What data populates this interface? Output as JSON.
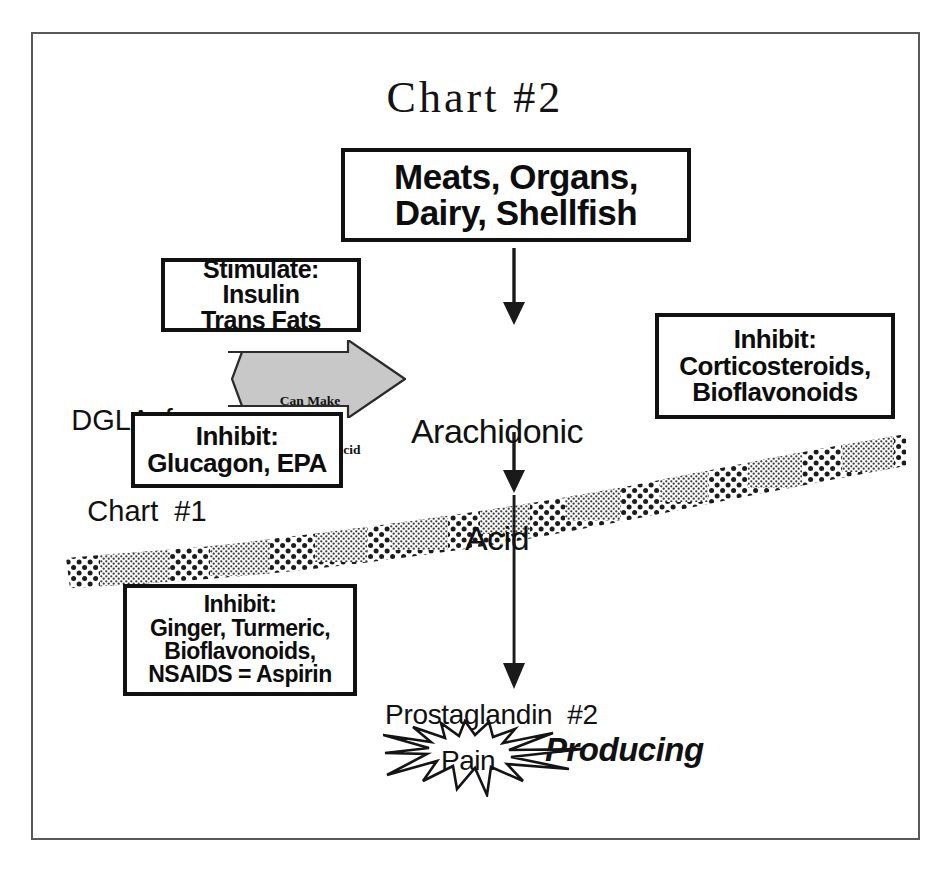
{
  "document": {
    "title": "Chart #2",
    "frame_color": "#595959"
  },
  "nodes": {
    "source": {
      "label_line1": "Meats, Organs,",
      "label_line2": "Dairy, Shellfish"
    },
    "arachidonic_acid": {
      "label_line1": "Arachidonic",
      "label_line2": "Acid"
    },
    "dgla": {
      "label_line1": "DGLA  from",
      "label_line2": "Chart  #1"
    },
    "prostaglandin": {
      "label": "Prostaglandin  #2",
      "emphasis": "Producing",
      "pain": "Pain"
    }
  },
  "modifiers": {
    "stimulate": {
      "heading": "Stimulate:",
      "line1": "Insulin",
      "line2": "Trans Fats"
    },
    "inhibit_glucagon": {
      "heading": "Inhibit:",
      "line1": "Glucagon, EPA"
    },
    "inhibit_corticosteroids": {
      "heading": "Inhibit:",
      "line1": "Corticosteroids,",
      "line2": "Bioflavonoids"
    },
    "inhibit_ginger": {
      "heading": "Inhibit:",
      "line1": "Ginger, Turmeric,",
      "line2": "Bioflavonoids,",
      "line3": "NSAIDS = Aspirin"
    }
  },
  "connectors": {
    "can_make_arrow": {
      "line1": "Can Make",
      "line2": "Arachidonic Acid",
      "fill_color": "#c8c8c8"
    }
  }
}
